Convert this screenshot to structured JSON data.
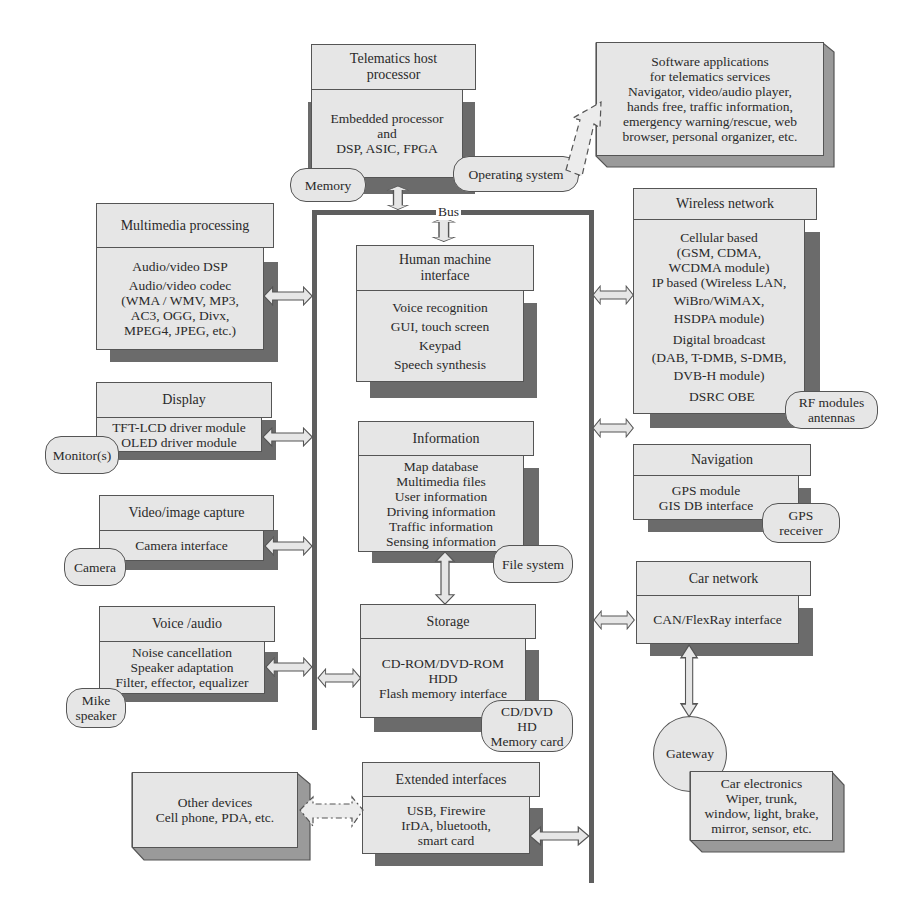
{
  "host": {
    "title_lines": [
      "Telematics host",
      "processor"
    ],
    "body_lines": [
      "Embedded processor",
      "and",
      "DSP, ASIC, FPGA"
    ],
    "memory_pill": "Memory",
    "os_pill": "Operating system"
  },
  "software": {
    "lines": [
      "Software applications",
      "for telematics services",
      "Navigator, video/audio player,",
      "hands free, traffic information,",
      "emergency warning/rescue, web",
      "browser, personal organizer, etc."
    ]
  },
  "bus": {
    "label": "Bus"
  },
  "left": {
    "multimedia": {
      "title": "Multimedia processing",
      "body_lines": [
        "Audio/video DSP",
        "Audio/video codec",
        "(WMA / WMV, MP3,",
        "AC3, OGG, Divx,",
        "MPEG4, JPEG, etc.)"
      ]
    },
    "display": {
      "title": "Display",
      "body_lines": [
        "TFT-LCD driver module",
        "OLED driver module"
      ],
      "pill": "Monitor(s)"
    },
    "video": {
      "title": "Video/image capture",
      "body_lines": [
        "Camera interface"
      ],
      "pill": "Camera"
    },
    "voice": {
      "title": "Voice /audio",
      "body_lines": [
        "Noise cancellation",
        "Speaker adaptation",
        "Filter, effector, equalizer"
      ],
      "pill_lines": [
        "Mike",
        "speaker"
      ]
    },
    "other_devices": {
      "lines": [
        "Other devices",
        "Cell phone, PDA, etc."
      ]
    }
  },
  "center": {
    "hmi": {
      "title_lines": [
        "Human machine",
        "interface"
      ],
      "body_lines": [
        "Voice recognition",
        "GUI, touch screen",
        "Keypad",
        "Speech synthesis"
      ]
    },
    "information": {
      "title": "Information",
      "body_lines": [
        "Map database",
        "Multimedia files",
        "User information",
        "Driving information",
        "Traffic information",
        "Sensing information"
      ],
      "pill": "File system"
    },
    "storage": {
      "title": "Storage",
      "body_lines": [
        "CD-ROM/DVD-ROM",
        "HDD",
        "Flash memory interface"
      ],
      "pill_lines": [
        "CD/DVD",
        "HD",
        "Memory card"
      ]
    },
    "extended": {
      "title": "Extended interfaces",
      "body_lines": [
        "USB, Firewire",
        "IrDA, bluetooth,",
        "smart card"
      ]
    }
  },
  "right": {
    "wireless": {
      "title": "Wireless network",
      "body_lines": [
        "Cellular based",
        "(GSM, CDMA,",
        "WCDMA module)",
        "IP based (Wireless LAN,",
        "WiBro/WiMAX,",
        "HSDPA module)",
        "Digital broadcast",
        "(DAB, T-DMB, S-DMB,",
        "DVB-H module)",
        "DSRC OBE"
      ],
      "pill_lines": [
        "RF modules",
        "antennas"
      ]
    },
    "navigation": {
      "title": "Navigation",
      "body_lines": [
        "GPS module",
        "GIS DB interface"
      ],
      "pill_lines": [
        "GPS",
        "receiver"
      ]
    },
    "car_network": {
      "title": "Car network",
      "body_lines": [
        "CAN/FlexRay interface"
      ]
    },
    "gateway": "Gateway",
    "car_electronics": {
      "lines": [
        "Car electronics",
        "Wiper, trunk,",
        "window, light, brake,",
        "mirror, sensor, etc."
      ]
    }
  },
  "colors": {
    "box_fill": "#e6e6e6",
    "shadow": "#6b6b6b",
    "bus": "#5e5e5e",
    "border": "#555555"
  }
}
